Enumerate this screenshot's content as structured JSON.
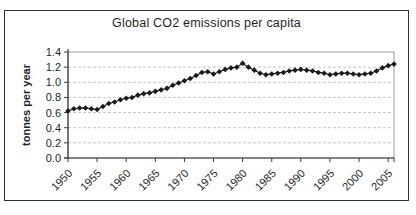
{
  "window": {
    "background": "#ffffff",
    "frame_border_color": "#2e2e2e"
  },
  "chart_data": {
    "type": "line",
    "title": "Global CO2 emissions per capita",
    "xlabel": "",
    "ylabel": "tonnes per year",
    "legend": "none",
    "grid": "horizontal-dashed",
    "marker": "diamond",
    "ylim": [
      0.0,
      1.4
    ],
    "ytick_labels": [
      "0.0",
      "0.2",
      "0.4",
      "0.6",
      "0.8",
      "1.0",
      "1.2",
      "1.4"
    ],
    "xtick_labels": [
      "1950",
      "1955",
      "1960",
      "1965",
      "1970",
      "1975",
      "1980",
      "1985",
      "1990",
      "1995",
      "2000",
      "2005"
    ],
    "xtick_every": 5,
    "x": [
      1950,
      1951,
      1952,
      1953,
      1954,
      1955,
      1956,
      1957,
      1958,
      1959,
      1960,
      1961,
      1962,
      1963,
      1964,
      1965,
      1966,
      1967,
      1968,
      1969,
      1970,
      1971,
      1972,
      1973,
      1974,
      1975,
      1976,
      1977,
      1978,
      1979,
      1980,
      1981,
      1982,
      1983,
      1984,
      1985,
      1986,
      1987,
      1988,
      1989,
      1990,
      1991,
      1992,
      1993,
      1994,
      1995,
      1996,
      1997,
      1998,
      1999,
      2000,
      2001,
      2002,
      2003,
      2004,
      2005,
      2006
    ],
    "series": [
      {
        "name": "Global CO2 emissions per capita",
        "values": [
          0.62,
          0.65,
          0.66,
          0.66,
          0.65,
          0.64,
          0.68,
          0.72,
          0.74,
          0.77,
          0.79,
          0.8,
          0.83,
          0.85,
          0.86,
          0.88,
          0.9,
          0.92,
          0.96,
          0.99,
          1.02,
          1.05,
          1.09,
          1.13,
          1.14,
          1.11,
          1.14,
          1.17,
          1.19,
          1.2,
          1.25,
          1.2,
          1.16,
          1.12,
          1.1,
          1.11,
          1.12,
          1.13,
          1.15,
          1.16,
          1.17,
          1.16,
          1.15,
          1.13,
          1.12,
          1.1,
          1.11,
          1.12,
          1.12,
          1.11,
          1.1,
          1.11,
          1.12,
          1.15,
          1.19,
          1.22,
          1.24
        ]
      }
    ],
    "colors": {
      "line": "#1a1a1a",
      "marker": "#1a1a1a",
      "grid": "#c6c6c6",
      "axis": "#3a3a3a",
      "plot_border": "#9a9a9a",
      "text": "#1f1f1f"
    }
  }
}
